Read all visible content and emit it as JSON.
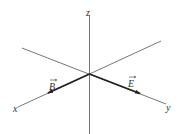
{
  "diagram": {
    "title": "",
    "axes": {
      "x": {
        "label": "x"
      },
      "y": {
        "label": "y"
      },
      "z": {
        "label": "z"
      }
    },
    "vectors": [
      {
        "name": "B",
        "label": "B",
        "direction": "+x"
      },
      {
        "name": "E",
        "label": "E",
        "direction": "+y"
      }
    ],
    "colors": {
      "axis": "#555555",
      "vector": "#222222",
      "text": "#333333"
    }
  }
}
